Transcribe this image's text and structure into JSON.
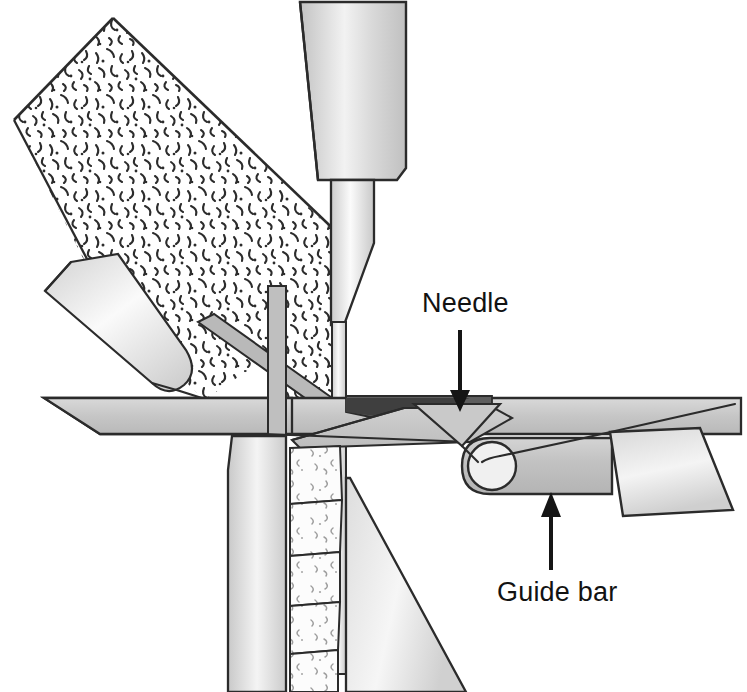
{
  "figure": {
    "type": "technical-cross-section",
    "background_color": "#ffffff",
    "line_color": "#2b2b2b",
    "annotation_text_color": "#121212"
  },
  "annotations": [
    {
      "id": "needle",
      "label": "Needle",
      "label_x": 422,
      "label_y": 312,
      "arrow": {
        "direction": "down",
        "x": 460,
        "y_start": 330,
        "y_end": 408
      }
    },
    {
      "id": "guide-bar",
      "label": "Guide bar",
      "label_x": 497,
      "label_y": 601,
      "arrow": {
        "direction": "up",
        "x": 551,
        "y_start": 570,
        "y_end": 492
      }
    }
  ],
  "parts": [
    {
      "id": "needle-holder",
      "name": "Needle holder / punch block",
      "fill": "#d2d2d2"
    },
    {
      "id": "needle-shaft",
      "name": "Needle shaft",
      "fill": "#dcdcdc"
    },
    {
      "id": "needle-wire",
      "name": "Needle wire",
      "fill": "#e6e6e6"
    },
    {
      "id": "fibre-web",
      "name": "Fibre web (nonwoven batt)",
      "fill": "#ffffff"
    },
    {
      "id": "feed-roller",
      "name": "Feed element",
      "fill": "#e2e2e2"
    },
    {
      "id": "stripper-plate",
      "name": "Stripper plate",
      "fill": "#c9c9c9"
    },
    {
      "id": "bed-plate",
      "name": "Bed plate",
      "fill": "#cfcfcf"
    },
    {
      "id": "knock-over-bit",
      "name": "Knock-over bit",
      "fill": "#6a6a6a"
    },
    {
      "id": "sinker",
      "name": "Sinker / trick plate",
      "fill": "#d0d0d0"
    },
    {
      "id": "guide-bar",
      "name": "Guide bar with eyelet",
      "fill": "#c6c6c6"
    },
    {
      "id": "guide-bar-hub",
      "name": "Guide bar carrier block",
      "fill": "#dadada"
    },
    {
      "id": "thread",
      "name": "Thread / yarn",
      "fill": "none"
    },
    {
      "id": "take-down",
      "name": "Take-down column",
      "fill": "#d4d4d4"
    },
    {
      "id": "fabric-stack",
      "name": "Bonded fabric courses",
      "fill": "#fbfbfb"
    },
    {
      "id": "support-wedge",
      "name": "Support wedge",
      "fill": "#d6d6d6"
    }
  ],
  "colors": {
    "light_gray": "#e4e4e4",
    "mid_gray": "#cfcfcf",
    "dark_gray": "#9a9a9a",
    "near_black": "#5a5a5a",
    "outline": "#2b2b2b"
  }
}
